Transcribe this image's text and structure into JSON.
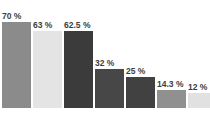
{
  "chart_data": {
    "type": "bar",
    "title": "",
    "subtitle": "",
    "xlabel": "",
    "ylabel": "",
    "ylim": [
      0,
      70
    ],
    "grid": false,
    "legend": "none",
    "categories": [
      "",
      "",
      "",
      "",
      "",
      "",
      ""
    ],
    "values": [
      70,
      63,
      62.5,
      32,
      25,
      14.3,
      12
    ],
    "data_labels": [
      "70 %",
      "63 %",
      "62.5 %",
      "32 %",
      "25 %",
      "14.3 %",
      "12 %"
    ],
    "bar_colors": [
      "#8b8b8b",
      "#e4e4e4",
      "#3b3b3b",
      "#474747",
      "#414141",
      "#909090",
      "#e1e1e1"
    ],
    "label_color": "#3d3d3d",
    "background": "#ffffff"
  }
}
